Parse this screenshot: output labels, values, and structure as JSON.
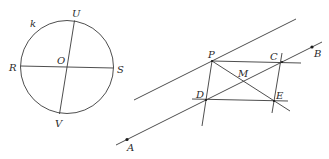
{
  "figure1": {
    "circle_label": "k",
    "points": {
      "U": "U",
      "V": "V",
      "R": "R",
      "S": "S",
      "O": "O"
    }
  },
  "figure2": {
    "points": {
      "A": "A",
      "B": "B",
      "P": "P",
      "C": "C",
      "D": "D",
      "E": "E",
      "M": "M"
    }
  },
  "colors": {
    "stroke": "#3a3a3a",
    "background": "#ffffff"
  }
}
